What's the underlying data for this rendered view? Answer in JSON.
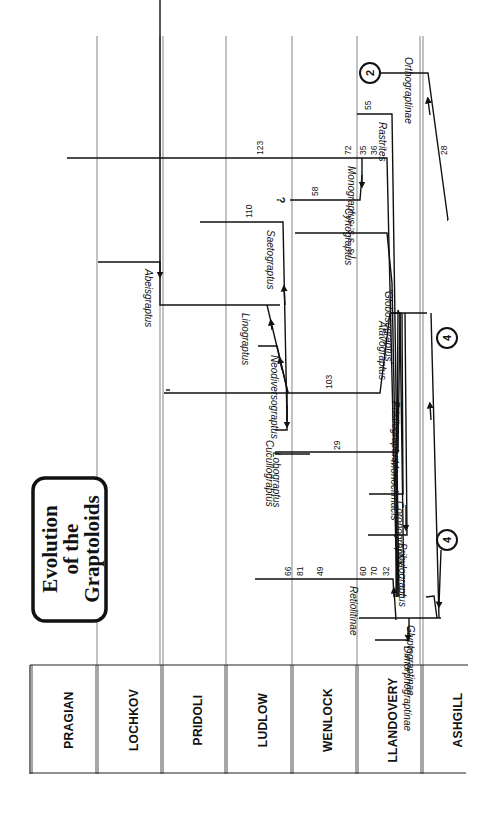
{
  "title": {
    "lines": [
      "Evolution",
      "of the",
      "Graptoloids"
    ]
  },
  "stages": [
    {
      "label": "PRAGIAN"
    },
    {
      "label": "LOCHKOV"
    },
    {
      "label": "PRIDOLI"
    },
    {
      "label": "LUDLOW"
    },
    {
      "label": "WENLOCK"
    },
    {
      "label": "LLANDOVERY"
    },
    {
      "label": "ASHGILL"
    }
  ],
  "taxa": {
    "orthograptinae": "Orthograptinae",
    "rastrites": "Rastrites",
    "monograptus": "Monograptus :s.s. s.l.",
    "cyrtograptus": "Cyrtograptus",
    "saetograptus": "Saetograptus",
    "globosograptus": "'Globosograptus'",
    "atavograptus": "Atavograptus",
    "pristiograptus": "Pristiograptus",
    "abeisgraptus": "Abeisgraptus",
    "linograptus": "Linograptus",
    "neodiversograptus": "Neodiversograptus",
    "cucullograptus": "Cucullograptus",
    "lobograptus": "Lobograptus",
    "monoclimacis": "Monoclimacis",
    "coronograptus": "Coronograptus",
    "pribylograptus": "Pribylograptus",
    "retiolitinae": "Retiolitinae",
    "glyptograptinae": "Glyptograptinae",
    "dimorphograptinae": "Dimorphograptinae"
  },
  "numbers": {
    "n28": "28",
    "n55": "55",
    "n123": "123",
    "n72": "72",
    "n35": "35",
    "n36": "36",
    "n58": "58",
    "n110": "110",
    "n103": "103",
    "n29": "29",
    "n66": "66",
    "n81": "81",
    "n49": "49",
    "n60": "60",
    "n70": "70",
    "n32": "32"
  },
  "markers": {
    "circle_2": "2",
    "circle_4a": "4",
    "circle_4b": "4",
    "question": "?"
  },
  "colors": {
    "ink": "#111111",
    "grid": "#555555",
    "background": "#ffffff"
  }
}
